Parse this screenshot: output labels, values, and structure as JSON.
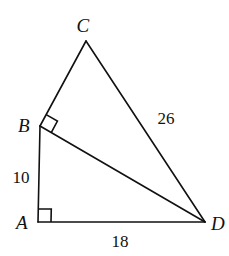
{
  "figure": {
    "canvas": {
      "width": 229,
      "height": 256,
      "background": "#ffffff"
    },
    "stroke_color": "#111111",
    "stroke_width": 1.6,
    "points": {
      "A": {
        "x": 38,
        "y": 222
      },
      "B": {
        "x": 40,
        "y": 126
      },
      "C": {
        "x": 86,
        "y": 41
      },
      "D": {
        "x": 205,
        "y": 222
      }
    },
    "segments": [
      {
        "name": "segment-AB",
        "from": "A",
        "to": "B"
      },
      {
        "name": "segment-AD",
        "from": "A",
        "to": "D"
      },
      {
        "name": "segment-BD",
        "from": "B",
        "to": "D"
      },
      {
        "name": "segment-BC",
        "from": "B",
        "to": "C"
      },
      {
        "name": "segment-CD",
        "from": "C",
        "to": "D"
      }
    ],
    "right_angles": [
      {
        "name": "right-angle-A",
        "vertex": "A",
        "size": 13
      },
      {
        "name": "right-angle-B",
        "vertex": "B",
        "size": 13
      }
    ]
  },
  "vertex_labels": [
    {
      "text": "C",
      "x": 83,
      "y": 25
    },
    {
      "text": "B",
      "x": 24,
      "y": 125
    },
    {
      "text": "A",
      "x": 22,
      "y": 222
    },
    {
      "text": "D",
      "x": 218,
      "y": 223
    }
  ],
  "length_labels": [
    {
      "text": "26",
      "x": 166,
      "y": 118
    },
    {
      "text": "10",
      "x": 21,
      "y": 177
    },
    {
      "text": "18",
      "x": 120,
      "y": 241
    }
  ]
}
